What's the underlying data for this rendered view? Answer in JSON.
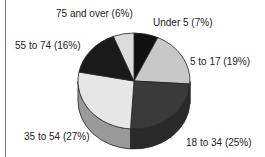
{
  "chart_data": {
    "type": "pie",
    "title": "",
    "style": "3d",
    "categories": [
      "Under 5",
      "5 to 17",
      "18 to 34",
      "35 to 54",
      "55 to 74",
      "75 and over"
    ],
    "values": [
      7,
      19,
      25,
      27,
      16,
      6
    ],
    "labels": [
      "Under 5  (7%)",
      "5 to 17 (19%)",
      "18 to 34 (25%)",
      "35 to 54 (27%)",
      "55 to 74 (16%)",
      "75 and over (6%)"
    ],
    "colors": [
      "#111111",
      "#c8c8c8",
      "#3a3a3a",
      "#e6e6e6",
      "#1a1a1a",
      "#dcdcdc"
    ],
    "legend": "none (inline labels)"
  }
}
